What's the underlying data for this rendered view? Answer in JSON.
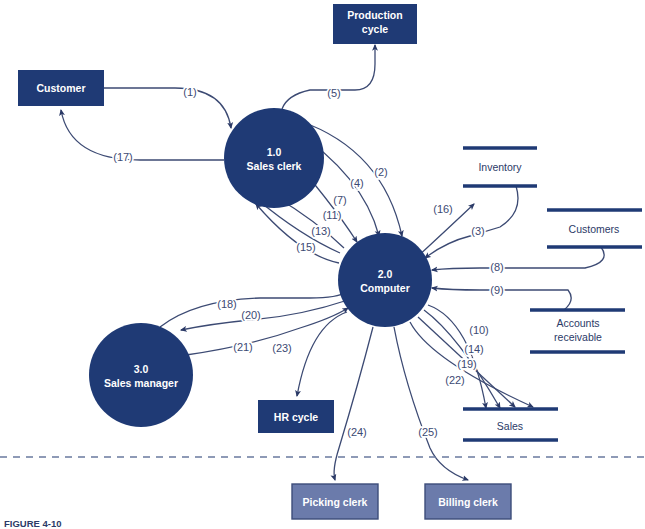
{
  "diagram": {
    "colors": {
      "entity_fill": "#1f3a75",
      "entity_fill_light": "#6b7bab",
      "entity_border_light": "#3d4d7a",
      "process_fill": "#1f3a75",
      "store_line": "#1f3a75",
      "flow_line": "#3c4a73",
      "label_text": "#3c4a73",
      "store_text": "#2b3a67",
      "white_text": "#ffffff",
      "divider": "#6a7a9e",
      "background": "#ffffff"
    },
    "external_entities": [
      {
        "id": "customer",
        "label": "Customer",
        "x": 18,
        "y": 70,
        "w": 86,
        "h": 36,
        "style": "dark"
      },
      {
        "id": "production-cycle",
        "label": "Production cycle",
        "x": 333,
        "y": 4,
        "w": 84,
        "h": 36,
        "style": "dark",
        "lines": [
          "Production",
          "cycle"
        ]
      },
      {
        "id": "hr-cycle",
        "label": "HR cycle",
        "x": 258,
        "y": 400,
        "w": 76,
        "h": 33,
        "style": "dark"
      },
      {
        "id": "picking-clerk",
        "label": "Picking clerk",
        "x": 292,
        "y": 484,
        "w": 86,
        "h": 35,
        "style": "light"
      },
      {
        "id": "billing-clerk",
        "label": "Billing clerk",
        "x": 425,
        "y": 484,
        "w": 86,
        "h": 35,
        "style": "light"
      }
    ],
    "processes": [
      {
        "id": "sales-clerk",
        "number": "1.0",
        "name": "Sales clerk",
        "cx": 274,
        "cy": 158,
        "r": 50
      },
      {
        "id": "computer",
        "number": "2.0",
        "name": "Computer",
        "cx": 385,
        "cy": 280,
        "r": 47
      },
      {
        "id": "sales-manager",
        "number": "3.0",
        "name": "Sales manager",
        "cx": 141,
        "cy": 375,
        "r": 52
      }
    ],
    "data_stores": [
      {
        "id": "inventory",
        "label": "Inventory",
        "x": 463,
        "y": 146,
        "w": 74,
        "label_lines": [
          "Inventory"
        ]
      },
      {
        "id": "customers",
        "label": "Customers",
        "x": 545,
        "y": 208,
        "w": 95,
        "label_lines": [
          "Customers"
        ]
      },
      {
        "id": "accounts-receivable",
        "label": "Accounts receivable",
        "x": 530,
        "y": 305,
        "w": 95,
        "label_lines": [
          "Accounts",
          "receivable"
        ]
      },
      {
        "id": "sales",
        "label": "Sales",
        "x": 463,
        "y": 402,
        "w": 95,
        "label_lines": [
          "Sales"
        ]
      }
    ],
    "flows": [
      {
        "id": "flow-1",
        "label": "(1)",
        "lx": 190,
        "ly": 92,
        "from": "customer",
        "to": "sales-clerk"
      },
      {
        "id": "flow-2",
        "label": "(2)",
        "lx": 381,
        "ly": 172,
        "from": "sales-clerk",
        "to": "computer"
      },
      {
        "id": "flow-3",
        "label": "(3)",
        "lx": 478,
        "ly": 231,
        "from": "inventory",
        "to": "computer"
      },
      {
        "id": "flow-4",
        "label": "(4)",
        "lx": 357,
        "ly": 183,
        "from": "sales-clerk",
        "to": "computer"
      },
      {
        "id": "flow-5",
        "label": "(5)",
        "lx": 334,
        "ly": 93,
        "from": "sales-clerk",
        "to": "production-cycle"
      },
      {
        "id": "flow-7",
        "label": "(7)",
        "lx": 340,
        "ly": 200,
        "from": "sales-clerk",
        "to": "computer"
      },
      {
        "id": "flow-8",
        "label": "(8)",
        "lx": 497,
        "ly": 267,
        "from": "customers",
        "to": "computer"
      },
      {
        "id": "flow-9",
        "label": "(9)",
        "lx": 497,
        "ly": 290,
        "from": "accounts-receivable",
        "to": "computer"
      },
      {
        "id": "flow-10",
        "label": "(10)",
        "lx": 479,
        "ly": 330,
        "from": "computer",
        "to": "sales"
      },
      {
        "id": "flow-11",
        "label": "(11)",
        "lx": 332,
        "ly": 215,
        "from": "computer",
        "to": "sales-clerk"
      },
      {
        "id": "flow-13",
        "label": "(13)",
        "lx": 321,
        "ly": 231,
        "from": "computer",
        "to": "sales-clerk"
      },
      {
        "id": "flow-14",
        "label": "(14)",
        "lx": 474,
        "ly": 349,
        "from": "computer",
        "to": "sales"
      },
      {
        "id": "flow-15",
        "label": "(15)",
        "lx": 306,
        "ly": 247,
        "from": "computer",
        "to": "sales-clerk"
      },
      {
        "id": "flow-16",
        "label": "(16)",
        "lx": 443,
        "ly": 209,
        "from": "computer",
        "to": "inventory"
      },
      {
        "id": "flow-17",
        "label": "(17)",
        "lx": 123,
        "ly": 157,
        "from": "sales-clerk",
        "to": "customer"
      },
      {
        "id": "flow-18",
        "label": "(18)",
        "lx": 227,
        "ly": 304,
        "from": "sales-manager",
        "to": "computer"
      },
      {
        "id": "flow-19",
        "label": "(19)",
        "lx": 467,
        "ly": 364,
        "from": "computer",
        "to": "sales"
      },
      {
        "id": "flow-20",
        "label": "(20)",
        "lx": 251,
        "ly": 315,
        "from": "computer",
        "to": "sales-manager"
      },
      {
        "id": "flow-21",
        "label": "(21)",
        "lx": 243,
        "ly": 347,
        "from": "sales-manager",
        "to": "computer"
      },
      {
        "id": "flow-22",
        "label": "(22)",
        "lx": 455,
        "ly": 380,
        "from": "computer",
        "to": "sales"
      },
      {
        "id": "flow-23",
        "label": "(23)",
        "lx": 282,
        "ly": 348,
        "from": "computer",
        "to": "hr-cycle"
      },
      {
        "id": "flow-24",
        "label": "(24)",
        "lx": 357,
        "ly": 432,
        "from": "computer",
        "to": "picking-clerk"
      },
      {
        "id": "flow-25",
        "label": "(25)",
        "lx": 428,
        "ly": 432,
        "from": "computer",
        "to": "billing-clerk"
      }
    ],
    "divider": {
      "id": "boundary-divider",
      "y": 457,
      "style": "dashed"
    },
    "caption": "FIGURE 4-10"
  }
}
